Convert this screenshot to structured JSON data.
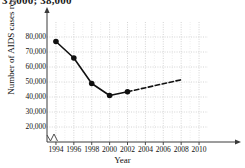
{
  "top_note": "37,000; 38,000",
  "chart_data": {
    "type": "line",
    "title": "",
    "xlabel": "Year",
    "ylabel": "Number of AIDS cases reported",
    "xlim": [
      1993,
      2011
    ],
    "ylim": [
      10000,
      90000
    ],
    "grid": true,
    "legend_position": "none",
    "x_ticks": [
      1994,
      1996,
      1998,
      2000,
      2002,
      2004,
      2006,
      2008,
      2010
    ],
    "x_tick_labels": [
      "1994",
      "1996",
      "1998",
      "2000",
      "2002",
      "2004",
      "2006",
      "2008",
      "2010"
    ],
    "y_ticks": [
      20000,
      30000,
      40000,
      50000,
      60000,
      70000,
      80000
    ],
    "y_tick_labels": [
      "20,000",
      "30,000",
      "40,000",
      "50,000",
      "60,000",
      "70,000",
      "80,000"
    ],
    "axis_break": true,
    "series": [
      {
        "name": "Reported AIDS cases",
        "style": "solid",
        "markers": true,
        "x": [
          1994,
          1996,
          1998,
          2000,
          2002
        ],
        "values": [
          77000,
          66000,
          49000,
          41000,
          43500
        ]
      },
      {
        "name": "Projected trend",
        "style": "dashed",
        "markers": false,
        "x": [
          2002,
          2008
        ],
        "values": [
          43500,
          51500
        ]
      }
    ]
  },
  "colors": {
    "line": "#111111",
    "marker": "#111111",
    "grid": "#c9c9c9",
    "axis": "#3a3a3a",
    "text": "#111111"
  }
}
